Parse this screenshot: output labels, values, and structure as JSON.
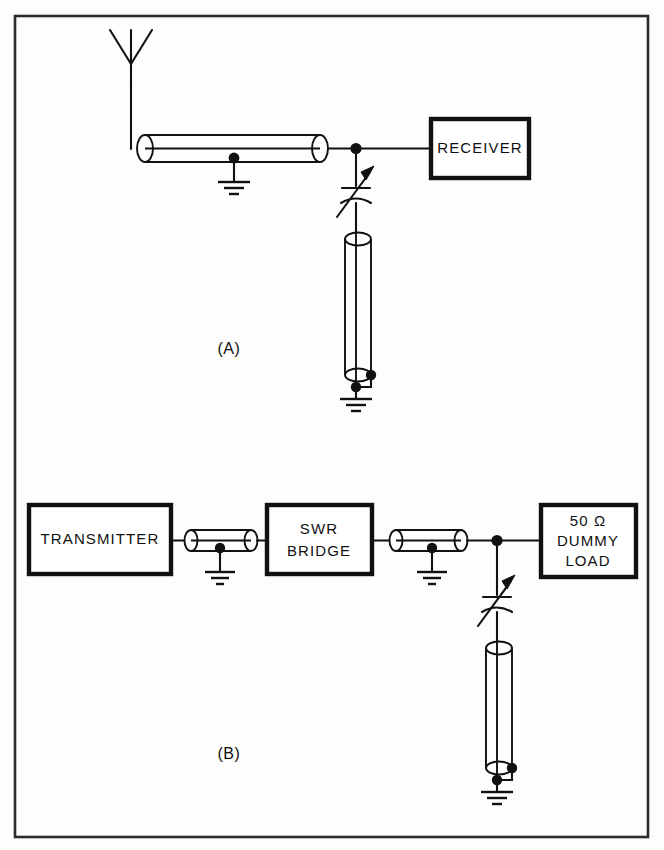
{
  "figure": {
    "panels": [
      {
        "id": "A",
        "label": "(A)",
        "description": "Receiver with antenna and tuned coaxial stub"
      },
      {
        "id": "B",
        "label": "(B)",
        "description": "Transmitter, SWR bridge and dummy load with tuned coaxial stub"
      }
    ]
  },
  "panel_a": {
    "label": "(A)",
    "receiver": {
      "label": "RECEIVER"
    },
    "antenna": {
      "name": "antenna"
    },
    "feedline": {
      "name": "coaxial-feedline"
    },
    "stub": {
      "name": "coaxial-stub"
    },
    "capacitor": {
      "name": "variable-capacitor"
    },
    "grounds": [
      "feedline-ground",
      "stub-ground"
    ]
  },
  "panel_b": {
    "label": "(B)",
    "transmitter": {
      "label": "TRANSMITTER"
    },
    "swr_bridge": {
      "label_line1": "SWR",
      "label_line2": "BRIDGE"
    },
    "dummy_load": {
      "label_line1": "50 Ω",
      "label_line2": "DUMMY",
      "label_line3": "LOAD"
    },
    "cables": [
      "coax-transmitter-to-bridge",
      "coax-bridge-to-load"
    ],
    "stub": {
      "name": "coaxial-stub"
    },
    "capacitor": {
      "name": "variable-capacitor"
    },
    "grounds": [
      "cable1-ground",
      "cable2-ground",
      "stub-ground"
    ]
  },
  "colors": {
    "ink": "#111111",
    "frame": "#2b2b2b",
    "paper": "#fdfdfc"
  }
}
